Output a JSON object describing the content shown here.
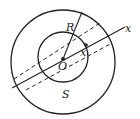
{
  "diagram": {
    "labels": {
      "radius": "R",
      "center": "O",
      "axis": "x",
      "distance": "x",
      "area": "S"
    },
    "colors": {
      "stroke": "#222222",
      "background": "#ffffff"
    }
  }
}
